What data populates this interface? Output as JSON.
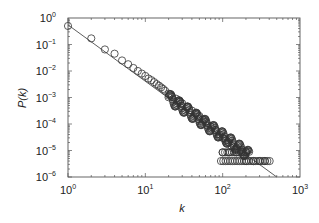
{
  "chart_data": {
    "type": "scatter",
    "title": "",
    "xlabel": "k",
    "ylabel": "P(k)",
    "xscale": "log",
    "yscale": "log",
    "xlim": [
      1,
      1000
    ],
    "ylim": [
      1e-06,
      1
    ],
    "x_ticks": [
      "10^0",
      "10^1",
      "10^2",
      "10^3"
    ],
    "y_ticks": [
      "10^0",
      "10^-1",
      "10^-2",
      "10^-3",
      "10^-4",
      "10^-5",
      "10^-6"
    ],
    "grid": false,
    "legend": null,
    "marker": "open-circle",
    "fit_line": {
      "type": "power-law",
      "exponent": -2.1,
      "from": [
        1,
        0.55
      ],
      "to": [
        500,
        1e-06
      ]
    },
    "series": [
      {
        "name": "P(k)",
        "x": [
          1,
          2,
          3,
          4,
          5,
          6,
          7,
          8,
          9,
          10,
          11,
          12,
          13,
          14,
          15,
          16,
          17,
          18,
          20,
          22,
          25,
          28,
          30,
          35,
          40,
          45,
          50,
          55,
          60,
          70,
          80,
          90,
          100,
          110,
          120,
          130,
          150,
          170,
          200,
          100,
          120,
          150,
          200,
          250,
          300,
          350
        ],
        "y": [
          0.5,
          0.17,
          0.065,
          0.045,
          0.025,
          0.018,
          0.013,
          0.01,
          0.008,
          0.0065,
          0.0052,
          0.0045,
          0.0038,
          0.0032,
          0.0028,
          0.0024,
          0.0021,
          0.0018,
          0.0014,
          0.0011,
          0.0009,
          0.0007,
          0.0006,
          0.00045,
          0.00032,
          0.00025,
          0.0002,
          0.00015,
          0.00012,
          8e-05,
          6e-05,
          4e-05,
          3e-05,
          2.5e-05,
          2e-05,
          1.5e-05,
          1.2e-05,
          1e-05,
          9e-06,
          8.5e-06,
          8.5e-06,
          8.5e-06,
          4e-06,
          4e-06,
          4e-06,
          4e-06
        ]
      }
    ]
  },
  "axes": {
    "xlabel": "k",
    "ylabel": "P(k)",
    "x_tick_labels": [
      {
        "base": "10",
        "exp": "0"
      },
      {
        "base": "10",
        "exp": "1"
      },
      {
        "base": "10",
        "exp": "2"
      },
      {
        "base": "10",
        "exp": "3"
      }
    ],
    "y_tick_labels": [
      {
        "base": "10",
        "exp": "0"
      },
      {
        "base": "10",
        "exp": "−1"
      },
      {
        "base": "10",
        "exp": "−2"
      },
      {
        "base": "10",
        "exp": "−3"
      },
      {
        "base": "10",
        "exp": "−4"
      },
      {
        "base": "10",
        "exp": "−5"
      },
      {
        "base": "10",
        "exp": "−6"
      }
    ]
  }
}
